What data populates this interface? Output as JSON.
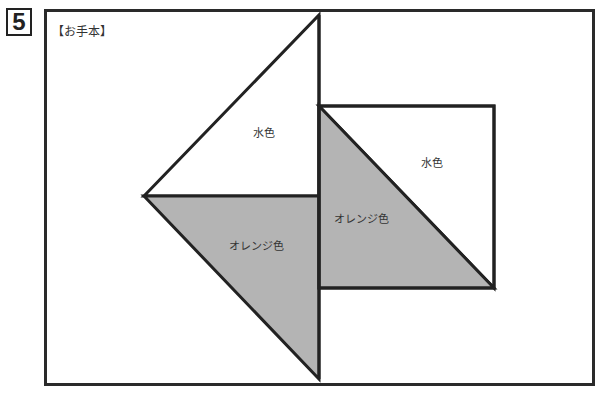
{
  "problem_number": "5",
  "caption": "【お手本】",
  "colors": {
    "gray_fill": "#b4b4b4",
    "stroke": "#222222",
    "white_fill": "#ffffff"
  },
  "shapes": {
    "upper_left_triangle": {
      "label": "水色",
      "fill": "white"
    },
    "lower_left_triangle": {
      "label": "オレンジ色",
      "fill": "gray"
    },
    "square_lower_triangle": {
      "label": "オレンジ色",
      "fill": "gray"
    },
    "square_upper_triangle": {
      "label": "水色",
      "fill": "white"
    }
  }
}
